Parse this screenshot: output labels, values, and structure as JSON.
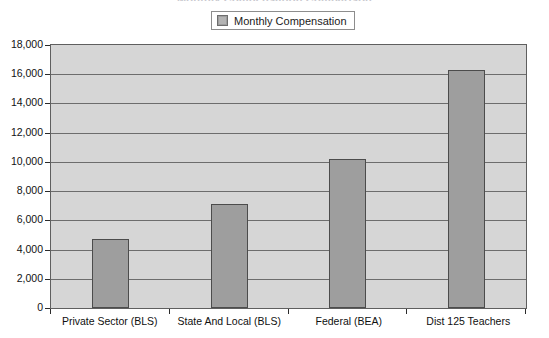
{
  "chart": {
    "title": "Monthly Compensation Comparison",
    "legend": {
      "position": "top-center",
      "entries": [
        {
          "label": "Monthly Compensation",
          "color": "#9e9e9e",
          "swatch": "legend-swatch-icon"
        }
      ]
    },
    "colors": {
      "bar_fill": "#9e9e9e",
      "bar_border": "#4c4c4c",
      "plot_background": "#d6d6d6",
      "gridline": "#6d6d6d",
      "axis": "#2b2b2b",
      "text": "#121212"
    }
  },
  "chart_data": {
    "type": "bar",
    "title": "Monthly Compensation Comparison",
    "xlabel": "",
    "ylabel": "",
    "categories": [
      "Private Sector (BLS)",
      "State And Local (BLS)",
      "Federal (BEA)",
      "Dist 125 Teachers"
    ],
    "series": [
      {
        "name": "Monthly Compensation",
        "values": [
          4700,
          7100,
          10200,
          16300
        ]
      }
    ],
    "values": [
      4700,
      7100,
      10200,
      16300
    ],
    "ylim": [
      0,
      18000
    ],
    "ytick_step": 2000,
    "ytick_labels": [
      "0",
      "2,000",
      "4,000",
      "6,000",
      "8,000",
      "10,000",
      "12,000",
      "14,000",
      "16,000",
      "18,000"
    ],
    "ytick_values": [
      0,
      2000,
      4000,
      6000,
      8000,
      10000,
      12000,
      14000,
      16000,
      18000
    ],
    "grid": true,
    "grid_axis": "y",
    "legend": "top-center"
  }
}
